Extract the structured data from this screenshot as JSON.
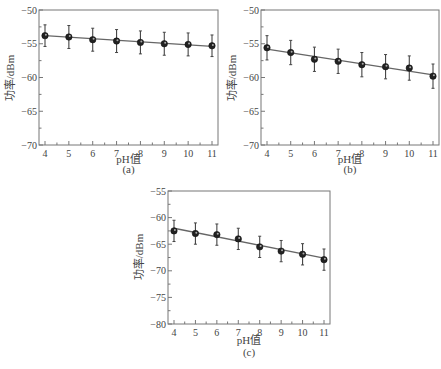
{
  "chart_data": [
    {
      "type": "line",
      "panel": "(a)",
      "xlabel": "pH值",
      "ylabel": "功率/dBm",
      "xlim": [
        4,
        11
      ],
      "ylim": [
        -70,
        -50
      ],
      "x_ticks": [
        4,
        5,
        6,
        7,
        8,
        9,
        10,
        11
      ],
      "y_ticks": [
        -50,
        -55,
        -60,
        -65,
        -70
      ],
      "grid": false,
      "series": [
        {
          "name": "measured",
          "x": [
            4,
            5,
            6,
            7,
            8,
            9,
            10,
            11
          ],
          "values": [
            -53.8,
            -54.0,
            -54.4,
            -54.6,
            -54.8,
            -55.0,
            -55.1,
            -55.3
          ],
          "error": [
            1.6,
            1.7,
            1.7,
            1.7,
            1.7,
            1.7,
            1.7,
            1.6
          ]
        },
        {
          "name": "fit",
          "x": [
            4,
            11
          ],
          "values": [
            -53.8,
            -55.4
          ]
        }
      ]
    },
    {
      "type": "line",
      "panel": "(b)",
      "xlabel": "pH值",
      "ylabel": "功率/dBm",
      "xlim": [
        4,
        11
      ],
      "ylim": [
        -70,
        -50
      ],
      "x_ticks": [
        4,
        5,
        6,
        7,
        8,
        9,
        10,
        11
      ],
      "y_ticks": [
        -50,
        -55,
        -60,
        -65,
        -70
      ],
      "grid": false,
      "series": [
        {
          "name": "measured",
          "x": [
            4,
            5,
            6,
            7,
            8,
            9,
            10,
            11
          ],
          "values": [
            -55.6,
            -56.3,
            -57.3,
            -57.6,
            -58.1,
            -58.4,
            -58.6,
            -59.8
          ],
          "error": [
            1.8,
            1.8,
            1.8,
            1.8,
            1.8,
            1.8,
            1.8,
            1.8
          ]
        },
        {
          "name": "fit",
          "x": [
            4,
            11
          ],
          "values": [
            -55.8,
            -59.6
          ]
        }
      ]
    },
    {
      "type": "line",
      "panel": "(c)",
      "xlabel": "pH值",
      "ylabel": "功率/dBm",
      "xlim": [
        4,
        11
      ],
      "ylim": [
        -80,
        -55
      ],
      "x_ticks": [
        4,
        5,
        6,
        7,
        8,
        9,
        10,
        11
      ],
      "y_ticks": [
        -55,
        -60,
        -65,
        -70,
        -75,
        -80
      ],
      "grid": false,
      "series": [
        {
          "name": "measured",
          "x": [
            4,
            5,
            6,
            7,
            8,
            9,
            10,
            11
          ],
          "values": [
            -62.5,
            -63.0,
            -63.2,
            -64.0,
            -65.5,
            -66.3,
            -66.9,
            -67.9
          ],
          "error": [
            2.0,
            2.0,
            2.0,
            2.0,
            2.0,
            2.0,
            2.0,
            2.0
          ]
        },
        {
          "name": "fit",
          "x": [
            4,
            11
          ],
          "values": [
            -62.0,
            -67.6
          ]
        }
      ]
    }
  ],
  "panels": [
    {
      "caption": "(a)",
      "xlabel": "pH值",
      "ylabel": "功率/dBm"
    },
    {
      "caption": "(b)",
      "xlabel": "pH值",
      "ylabel": "功率/dBm"
    },
    {
      "caption": "(c)",
      "xlabel": "pH值",
      "ylabel": "功率/dBm"
    }
  ]
}
